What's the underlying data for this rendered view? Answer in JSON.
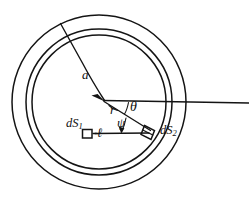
{
  "figure": {
    "kind": "physics-diagram",
    "background_color": "#ffffff",
    "ink_color": "#141414"
  },
  "geometry": {
    "center": {
      "x": 99,
      "y": 102
    },
    "circles": [
      {
        "name": "inner-cavity-circle",
        "radius": 67
      },
      {
        "name": "middle-wall-circle",
        "radius": 73
      },
      {
        "name": "outer-wall-circle",
        "radius": 87
      }
    ],
    "radius_line_a": {
      "from_x": 103,
      "from_y": 100,
      "to_x": 60,
      "to_y": 23
    },
    "axis_line": {
      "from_x": 103,
      "from_y": 100,
      "to_x": 249,
      "to_y": 103
    },
    "r_line": {
      "from_x": 103,
      "from_y": 100,
      "to_x": 150,
      "to_y": 131
    },
    "ell_line": {
      "from_x": 94,
      "from_y": 133,
      "to_x": 148,
      "to_y": 133
    },
    "element_ds1": {
      "x": 86,
      "y": 133,
      "width": 9,
      "height": 8
    },
    "element_ds2": {
      "x": 150,
      "y": 130,
      "width": 11,
      "height": 9
    }
  },
  "labels": {
    "a": "a",
    "r": "r",
    "theta": "θ",
    "psi": "ψ",
    "dS1_prefix": "dS",
    "dS1_sub": "1",
    "ell": "ℓ",
    "dS2_prefix": "dS",
    "dS2_sub": "2"
  },
  "icon_names": {
    "arrowhead": "arrowhead-icon",
    "surface-element-1": "square-element-icon",
    "surface-element-2": "parallelogram-element-icon"
  }
}
